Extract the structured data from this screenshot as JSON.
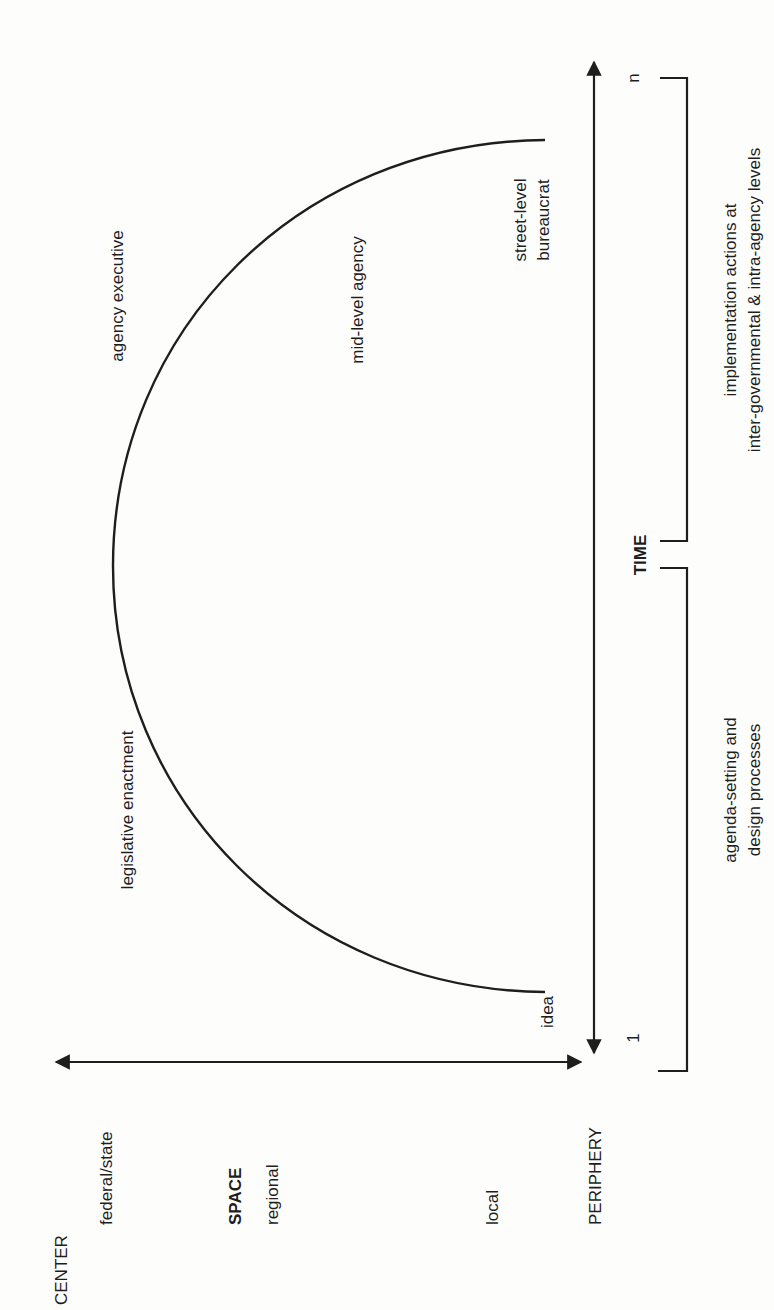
{
  "orientation": "rotated -90deg (text reads bottom-to-top)",
  "space_axis": {
    "label": "SPACE",
    "top_label": "CENTER",
    "bottom_label": "PERIPHERY",
    "levels": [
      "federal/state",
      "regional",
      "local"
    ]
  },
  "time_axis": {
    "label": "TIME",
    "start": "1",
    "end": "n"
  },
  "arc_labels": {
    "start": "idea",
    "legislative": "legislative enactment",
    "executive": "agency executive",
    "mid_level": "mid-level agency",
    "street_level_line1": "street-level",
    "street_level_line2": "bureaucrat"
  },
  "phases": [
    {
      "line1": "agenda-setting and",
      "line2": "design processes"
    },
    {
      "line1": "implementation actions at",
      "line2": "inter-governmental & intra-agency levels"
    }
  ],
  "colors": {
    "ink": "#1e1e1e",
    "paper": "#fdfdfc"
  }
}
